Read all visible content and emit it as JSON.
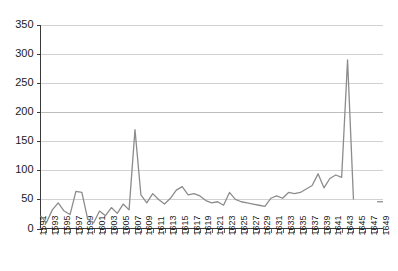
{
  "chart_data": {
    "type": "line",
    "title": "",
    "subtitle": "",
    "xlabel": "",
    "ylabel": "",
    "grid": true,
    "legend": false,
    "legend_position": "none",
    "series_color": "#8c8c8c",
    "xlim": [
      1591,
      1649
    ],
    "ylim": [
      0,
      350
    ],
    "y_ticks": [
      0,
      50,
      100,
      150,
      200,
      250,
      300,
      350
    ],
    "y_tick_labels": [
      "0",
      "50",
      "100",
      "150",
      "200",
      "250",
      "300",
      "350"
    ],
    "x_tick_labels": [
      "1591",
      "1593",
      "1595",
      "1597",
      "1599",
      "1601",
      "1603",
      "1605",
      "1607",
      "1609",
      "1611",
      "1613",
      "1615",
      "1617",
      "1619",
      "1621",
      "1623",
      "1625",
      "1627",
      "1629",
      "1631",
      "1633",
      "1635",
      "1637",
      "1639",
      "1641",
      "1643",
      "1645",
      "1647",
      "1649"
    ],
    "x": [
      1591,
      1592,
      1593,
      1594,
      1595,
      1596,
      1597,
      1598,
      1599,
      1600,
      1601,
      1602,
      1603,
      1604,
      1605,
      1606,
      1607,
      1608,
      1609,
      1610,
      1611,
      1612,
      1613,
      1614,
      1615,
      1616,
      1617,
      1618,
      1619,
      1620,
      1621,
      1622,
      1623,
      1624,
      1625,
      1626,
      1627,
      1628,
      1629,
      1630,
      1631,
      1632,
      1633,
      1634,
      1635,
      1636,
      1637,
      1638,
      1639,
      1640,
      1641,
      1642,
      1643,
      1644,
      1645,
      1646,
      1647,
      1648,
      1649
    ],
    "values": [
      22,
      10,
      32,
      44,
      30,
      24,
      64,
      62,
      16,
      10,
      30,
      22,
      36,
      26,
      42,
      32,
      170,
      58,
      44,
      60,
      50,
      42,
      52,
      66,
      72,
      58,
      60,
      56,
      48,
      44,
      46,
      40,
      62,
      50,
      46,
      44,
      42,
      40,
      38,
      52,
      56,
      52,
      62,
      60,
      62,
      68,
      74,
      94,
      70,
      86,
      92,
      88,
      290,
      50,
      null,
      null,
      null,
      46,
      46
    ],
    "annotations": [
      {
        "x": 1607,
        "y": 170,
        "note": "spike"
      },
      {
        "x": 1643,
        "y": 290,
        "note": "peak"
      }
    ]
  },
  "axes": {
    "y_axis_name": "value-axis",
    "x_axis_name": "year-axis"
  }
}
